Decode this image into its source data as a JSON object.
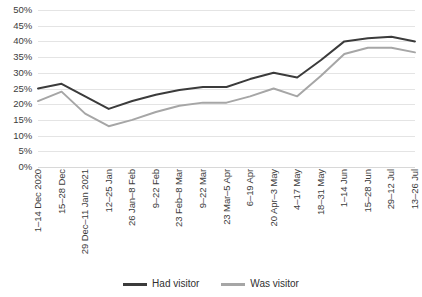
{
  "chart_data": {
    "type": "line",
    "title": "",
    "xlabel": "",
    "ylabel": "",
    "ylim": [
      0,
      50
    ],
    "yticks": [
      "0%",
      "5%",
      "10%",
      "15%",
      "20%",
      "25%",
      "30%",
      "35%",
      "40%",
      "45%",
      "50%"
    ],
    "ytick_values": [
      0,
      5,
      10,
      15,
      20,
      25,
      30,
      35,
      40,
      45,
      50
    ],
    "grid": true,
    "legend_position": "bottom",
    "categories": [
      "1–14 Dec 2020",
      "15–28 Dec",
      "29 Dec–11 Jan 2021",
      "12–25 Jan",
      "26 Jan–8 Feb",
      "9–22 Feb",
      "23 Feb–8 Mar",
      "9–22 Mar",
      "23 Mar–5 Apr",
      "6–19 Apr",
      "20 Apr–3 May",
      "4–17 May",
      "18–31 May",
      "1–14 Jun",
      "15–28 Jun",
      "29–12 Jul",
      "13–26 Jul"
    ],
    "series": [
      {
        "name": "Had visitor",
        "color": "#3b3b3b",
        "values": [
          25.0,
          26.5,
          22.5,
          18.5,
          21.0,
          23.0,
          24.5,
          25.5,
          25.5,
          28.0,
          30.0,
          28.5,
          34.0,
          40.0,
          41.0,
          41.5,
          40.0
        ]
      },
      {
        "name": "Was visitor",
        "color": "#a6a6a6",
        "values": [
          21.0,
          24.0,
          17.0,
          13.0,
          15.0,
          17.5,
          19.5,
          20.5,
          20.5,
          22.5,
          25.0,
          22.5,
          29.0,
          36.0,
          38.0,
          38.0,
          36.5
        ]
      }
    ]
  }
}
